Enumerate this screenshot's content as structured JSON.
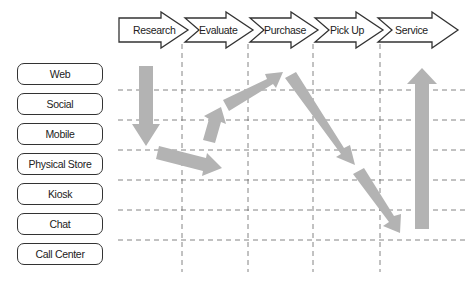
{
  "stages": [
    {
      "label": "Research"
    },
    {
      "label": "Evaluate"
    },
    {
      "label": "Purchase"
    },
    {
      "label": "Pick Up"
    },
    {
      "label": "Service"
    }
  ],
  "channels": [
    {
      "label": "Web"
    },
    {
      "label": "Social"
    },
    {
      "label": "Mobile"
    },
    {
      "label": "Physical Store"
    },
    {
      "label": "Kiosk"
    },
    {
      "label": "Chat"
    },
    {
      "label": "Call Center"
    }
  ],
  "journey_path": [
    {
      "from": "Web / Research",
      "to": "Mobile / Research",
      "direction": "down"
    },
    {
      "from": "Physical Store / Research",
      "to": "Physical Store / Evaluate",
      "direction": "right-down"
    },
    {
      "from": "Mobile / Evaluate",
      "to": "Social / Evaluate",
      "direction": "up"
    },
    {
      "from": "Social / Evaluate",
      "to": "Web / Purchase",
      "direction": "right-up"
    },
    {
      "from": "Web / Purchase",
      "to": "Physical Store / Pick Up",
      "direction": "right-down"
    },
    {
      "from": "Kiosk / Pick Up",
      "to": "Call Center / Pick Up",
      "direction": "right-down"
    },
    {
      "from": "Call Center / Service",
      "to": "Web / Service",
      "direction": "up"
    }
  ],
  "colors": {
    "arrow_fill": "#b3b3b3",
    "outline": "#333333",
    "gridline": "#666666"
  }
}
